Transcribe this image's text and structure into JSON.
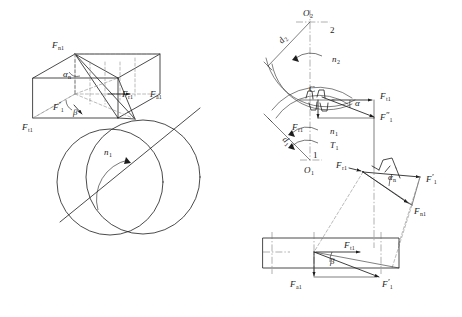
{
  "figure": {
    "background_color": "#ffffff",
    "line_color": "#1d1d1d",
    "hidden_line_color": "#8d8d8d",
    "center_line_color": "#6f6f6f"
  },
  "left_view": {
    "name": "Spatial force parallelepiped on helical pinion",
    "labels": {
      "normal_force": "F",
      "normal_force_sub": "n1",
      "radial_force": "F",
      "radial_force_sub": "r1",
      "axial_force": "F",
      "axial_force_sub": "a1",
      "tangential_force": "F",
      "tangential_force_sub": "t1",
      "resultant_force": "F",
      "resultant_force_prime": "′",
      "resultant_force_sub": "1",
      "normal_pressure_angle": "α",
      "normal_pressure_angle_sub": "n",
      "helix_angle": "β",
      "rotation_speed": "n",
      "rotation_speed_sub": "1"
    }
  },
  "right_view": {
    "name": "Projection views of meshing gear pair forces",
    "labels": {
      "center_2": "O",
      "center_2_sub": "2",
      "center_1": "O",
      "center_1_sub": "1",
      "pitch_dia_2": "d",
      "pitch_dia_2_sub": "2",
      "pitch_dia_1": "d",
      "pitch_dia_1_sub": "1",
      "gear_2_number": "2",
      "gear_1_number": "1",
      "speed_2": "n",
      "speed_2_sub": "2",
      "speed_1": "n",
      "speed_1_sub": "1",
      "torque_1": "T",
      "torque_1_sub": "1",
      "mesh_point": "C",
      "pressure_angle": "α",
      "normal_pressure_angle": "α",
      "normal_pressure_angle_sub": "n",
      "helix_angle": "β",
      "tangential_force": "F",
      "tangential_force_sub": "t1",
      "radial_force": "F",
      "radial_force_sub": "r1",
      "axial_force": "F",
      "axial_force_sub": "a1",
      "normal_force": "F",
      "normal_force_sub": "n1",
      "resultant_prime": "F",
      "resultant_prime_mark": "′",
      "resultant_prime_sub": "1",
      "resultant_dprime": "F",
      "resultant_dprime_mark": "″",
      "resultant_dprime_sub": "1"
    }
  }
}
